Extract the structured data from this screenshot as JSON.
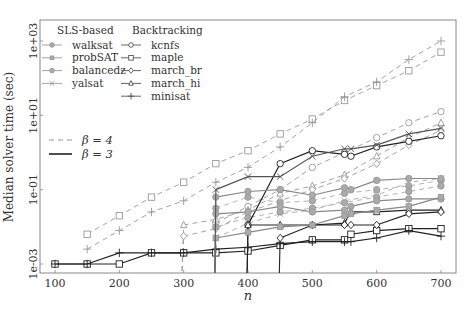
{
  "chart_data": {
    "type": "line",
    "title": "",
    "xlabel": "n",
    "ylabel": "Median solver time (sec)",
    "yscale": "log",
    "xlim": [
      80,
      720
    ],
    "ylim_log10": [
      -3.6,
      3.5
    ],
    "xticks": [
      100,
      200,
      300,
      400,
      500,
      600,
      700
    ],
    "yticks": [
      {
        "label": "1e-03",
        "log10": -3
      },
      {
        "label": "1e-01",
        "log10": -1
      },
      {
        "label": "1e+01",
        "log10": 1
      },
      {
        "label": "1e+03",
        "log10": 3
      }
    ],
    "grid": false,
    "legend": {
      "position": "upper left",
      "groups": [
        {
          "title": "SLS-based",
          "entries": [
            {
              "label": "walksat",
              "marker": "circle-filled"
            },
            {
              "label": "probSAT",
              "marker": "square-filled"
            },
            {
              "label": "balancedz",
              "marker": "circle-filled"
            },
            {
              "label": "yalsat",
              "marker": "x"
            }
          ]
        },
        {
          "title": "Backtracking",
          "entries": [
            {
              "label": "kcnfs",
              "marker": "circle"
            },
            {
              "label": "maple",
              "marker": "square"
            },
            {
              "label": "march_br",
              "marker": "diamond"
            },
            {
              "label": "march_hi",
              "marker": "triangle"
            },
            {
              "label": "minisat",
              "marker": "plus"
            }
          ]
        }
      ],
      "style_entries": [
        {
          "label": "β = 4",
          "linestyle": "dashed"
        },
        {
          "label": "β = 3",
          "linestyle": "solid"
        }
      ]
    },
    "series": [
      {
        "name": "maple",
        "beta": 4,
        "style": "dashed",
        "marker": "square",
        "color": "#999999",
        "x": [
          150,
          200,
          250,
          300,
          350,
          400,
          450,
          500,
          550,
          600,
          650,
          700
        ],
        "log10": [
          -2.2,
          -1.7,
          -1.2,
          -0.8,
          -0.3,
          0.05,
          0.5,
          0.9,
          1.4,
          1.8,
          2.2,
          2.7
        ]
      },
      {
        "name": "minisat",
        "beta": 4,
        "style": "dashed",
        "marker": "plus",
        "color": "#999999",
        "x": [
          150,
          200,
          250,
          300,
          350,
          400,
          450,
          500,
          550,
          600,
          650,
          700
        ],
        "log10": [
          -2.6,
          -2.1,
          -1.6,
          -1.3,
          -0.8,
          -0.4,
          0.15,
          0.8,
          1.5,
          1.9,
          2.5,
          3.0
        ]
      },
      {
        "name": "kcnfs",
        "beta": 4,
        "style": "dashed",
        "marker": "circle",
        "color": "#999999",
        "x": [
          350,
          400,
          450,
          500,
          550,
          600,
          650,
          700
        ],
        "log10": [
          -1.9,
          -1.45,
          -1.0,
          -0.4,
          0.0,
          0.4,
          0.8,
          1.1
        ]
      },
      {
        "name": "march_hi",
        "beta": 4,
        "style": "dashed",
        "marker": "triangle",
        "color": "#999999",
        "x": [
          300,
          350,
          400,
          450,
          500,
          550,
          600,
          650,
          700
        ],
        "log10": [
          -1.95,
          -1.8,
          -1.55,
          -1.1,
          -0.9,
          -0.6,
          -0.1,
          0.4,
          0.8
        ]
      },
      {
        "name": "march_br",
        "beta": 4,
        "style": "dashed",
        "marker": "diamond",
        "color": "#999999",
        "x": [
          300,
          350,
          400,
          450,
          500,
          550,
          600,
          650,
          700
        ],
        "log10": [
          -2.25,
          -2.05,
          -1.6,
          -1.3,
          -1.0,
          -0.7,
          -0.3,
          0.2,
          0.6
        ]
      },
      {
        "name": "walksat",
        "beta": 4,
        "style": "dashed",
        "marker": "circle-filled",
        "color": "#aaaaaa",
        "x": [
          350,
          400,
          450,
          500,
          550,
          600,
          650,
          700
        ],
        "log10": [
          -1.5,
          -1.2,
          -1.35,
          -1.3,
          -1.1,
          -1.0,
          -0.9,
          -0.75
        ]
      },
      {
        "name": "yalsat",
        "beta": 4,
        "style": "dashed",
        "marker": "x",
        "color": "#aaaaaa",
        "x": [
          350,
          400,
          450,
          500,
          550,
          600,
          650,
          700
        ],
        "log10": [
          -2.3,
          -1.9,
          -1.65,
          -1.55,
          -1.3,
          -1.15,
          -0.8,
          -0.7
        ]
      },
      {
        "name": "balancedz",
        "beta": 4,
        "style": "dashed",
        "marker": "circle-filled",
        "color": "#aaaaaa",
        "x": [
          350,
          400,
          450,
          500,
          550,
          600,
          650,
          700
        ],
        "log10": [
          -2.0,
          -1.75,
          -1.6,
          -1.5,
          -1.35,
          -1.2,
          -1.05,
          -0.9
        ]
      },
      {
        "name": "maple",
        "beta": 3,
        "style": "solid",
        "marker": "square",
        "color": "#222222",
        "x": [
          100,
          150,
          200,
          250,
          300,
          350,
          400,
          450,
          500,
          550,
          560,
          600,
          650,
          700
        ],
        "log10": [
          -3.0,
          -3.0,
          -3.0,
          -2.7,
          -2.7,
          -2.7,
          -2.65,
          -2.5,
          -2.35,
          -2.35,
          -2.2,
          -2.1,
          -2.05,
          -2.05
        ]
      },
      {
        "name": "minisat",
        "beta": 3,
        "style": "solid",
        "marker": "plus",
        "color": "#222222",
        "x": [
          100,
          150,
          200,
          250,
          300,
          350,
          400,
          450,
          500,
          550,
          560,
          600,
          650,
          700
        ],
        "log10": [
          -3.0,
          -3.0,
          -2.7,
          -2.7,
          -2.7,
          -2.6,
          -2.55,
          -2.45,
          -2.4,
          -2.4,
          -2.4,
          -2.3,
          -2.1,
          -2.25
        ]
      },
      {
        "name": "kcnfs",
        "beta": 3,
        "style": "solid",
        "marker": "circle",
        "color": "#222222",
        "x": [
          400,
          450,
          500,
          550,
          560,
          600,
          650,
          700
        ],
        "log10": [
          -1.95,
          -0.3,
          0.05,
          -0.05,
          -0.1,
          0.15,
          0.3,
          0.45
        ]
      },
      {
        "name": "march_hi",
        "beta": 3,
        "style": "solid",
        "marker": "triangle",
        "color": "#222222",
        "x": [
          400,
          450,
          500,
          550,
          560,
          600,
          650,
          700
        ],
        "log10": [
          -1.95,
          -1.95,
          -1.95,
          -1.9,
          -1.6,
          -1.6,
          -1.55,
          -1.55
        ]
      },
      {
        "name": "march_br",
        "beta": 3,
        "style": "solid",
        "marker": "diamond",
        "color": "#222222",
        "x": [
          450,
          500,
          550,
          560,
          600,
          650,
          700
        ],
        "log10": [
          -2.3,
          -1.95,
          -1.95,
          -1.95,
          -1.95,
          -1.65,
          -1.6
        ]
      },
      {
        "name": "walksat",
        "beta": 3,
        "style": "solid",
        "marker": "circle-filled",
        "color": "#888888",
        "x": [
          350,
          400,
          450,
          500,
          550,
          560,
          600,
          650,
          700
        ],
        "log10": [
          -1.2,
          -1.05,
          -1.0,
          -1.15,
          -0.95,
          -1.0,
          -0.75,
          -0.7,
          -0.7
        ]
      },
      {
        "name": "balancedz",
        "beta": 3,
        "style": "solid",
        "marker": "circle-filled",
        "color": "#888888",
        "x": [
          350,
          400,
          450,
          500,
          550,
          560,
          600,
          650,
          700
        ],
        "log10": [
          -1.65,
          -1.6,
          -1.45,
          -1.6,
          -1.55,
          -1.45,
          -1.3,
          -1.25,
          -1.25
        ]
      },
      {
        "name": "probSAT",
        "beta": 3,
        "style": "solid",
        "marker": "square-filled",
        "color": "#888888",
        "x": [
          350,
          400,
          450,
          500,
          550,
          560,
          600,
          650,
          700
        ],
        "log10": [
          -2.3,
          -2.15,
          -2.0,
          -1.95,
          -1.7,
          -1.65,
          -1.55,
          -1.45,
          -1.2
        ]
      },
      {
        "name": "yalsat",
        "beta": 3,
        "style": "solid",
        "marker": "x",
        "color": "#555555",
        "x": [
          350,
          400,
          450,
          500,
          550,
          560,
          600,
          650,
          700
        ],
        "log10": [
          -1.0,
          -0.65,
          -0.65,
          -0.1,
          0.1,
          0.1,
          0.2,
          0.5,
          0.65
        ]
      }
    ]
  }
}
